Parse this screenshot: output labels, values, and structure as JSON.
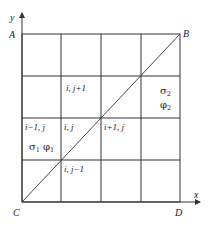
{
  "figure": {
    "type": "finite-difference grid with diagonal interface",
    "axes": {
      "x_label": "x",
      "y_label": "y"
    },
    "corners": {
      "top_left": "A",
      "top_right": "B",
      "bottom_left": "C",
      "bottom_right": "D"
    },
    "grid": {
      "columns": 4,
      "rows": 4
    },
    "diagonal": {
      "from": "C",
      "to": "B"
    },
    "cells": {
      "top_mid": "i, j+1",
      "left": "i−1, j",
      "center": "i, j",
      "right": "i+1, j",
      "bottom": "i, j−1"
    },
    "regions": {
      "region1": {
        "sigma": "σ",
        "sigma_sub": "1",
        "phi": "φ",
        "phi_sub": "1"
      },
      "region2": {
        "sigma": "σ",
        "sigma_sub": "2",
        "phi": "φ",
        "phi_sub": "2"
      }
    }
  }
}
